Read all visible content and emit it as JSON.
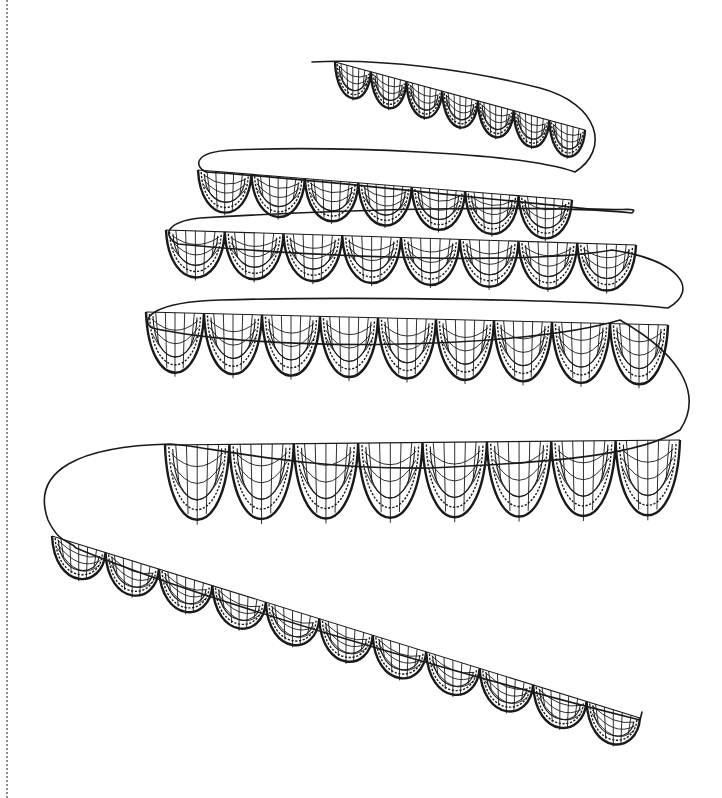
{
  "artwork": {
    "title": "Spiral lace ribbon line drawing",
    "background": "#ffffff",
    "ink_color": "#1a1a1a",
    "margin_rule": {
      "style": "dotted",
      "x": 6,
      "color": "#8a8a8a"
    },
    "ribbon_path": "M 312 62 C 380 58, 470 70, 540 88 C 600 104, 610 150, 575 172 C 520 152, 330 146, 232 150 C 190 152, 196 168, 206 172 C 300 178, 460 196, 560 206 C 620 214, 640 205, 632 213 C 560 205, 360 208, 200 218 C 165 222, 162 236, 178 244 C 300 256, 520 266, 612 250 C 680 260, 700 290, 668 308 C 600 300, 360 296, 220 300 C 150 302, 140 320, 152 328 C 260 352, 520 350, 620 320 C 690 360, 700 400, 680 430 C 640 455, 560 462, 430 468 C 300 470, 200 445, 170 444 C 80 446, 30 470, 48 520 C 60 545, 70 540, 76 548 C 200 600, 480 680, 640 720 L 642 712",
    "tiers": [
      {
        "name": "tier-1",
        "x0": 335,
        "y0": 62,
        "x1": 585,
        "y1": 130,
        "count": 7,
        "depth": 42,
        "tilt": 0.27
      },
      {
        "name": "tier-2",
        "x0": 198,
        "y0": 170,
        "x1": 572,
        "y1": 200,
        "count": 7,
        "depth": 54,
        "tilt": 0.06
      },
      {
        "name": "tier-3",
        "x0": 166,
        "y0": 230,
        "x1": 636,
        "y1": 245,
        "count": 8,
        "depth": 62,
        "tilt": 0.02
      },
      {
        "name": "tier-4",
        "x0": 146,
        "y0": 312,
        "x1": 668,
        "y1": 325,
        "count": 9,
        "depth": 80,
        "tilt": 0.0
      },
      {
        "name": "tier-5",
        "x0": 165,
        "y0": 445,
        "x1": 680,
        "y1": 440,
        "count": 8,
        "depth": 100,
        "tilt": 0.0
      },
      {
        "name": "tier-6",
        "x0": 52,
        "y0": 536,
        "x1": 640,
        "y1": 718,
        "count": 11,
        "depth": 46,
        "tilt": 0.31
      }
    ]
  }
}
